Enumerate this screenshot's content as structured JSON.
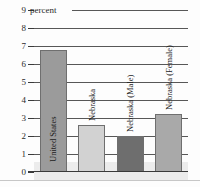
{
  "chart_data": {
    "type": "bar",
    "title": "",
    "subtitle": "",
    "xlabel": "",
    "ylabel": "percent",
    "unit_caption": "percent",
    "ylim": [
      0,
      9
    ],
    "grid": true,
    "legend": "none",
    "y_ticks": [
      "0",
      "1",
      "2",
      "3",
      "4",
      "5",
      "6",
      "7",
      "8",
      "9"
    ],
    "categories": [
      "United States",
      "Nebraska",
      "Nebraska (Male)",
      "Nebraska (Female)"
    ],
    "values": [
      6.8,
      2.6,
      2.0,
      3.2
    ],
    "bar_colors": [
      "#9b9b9b",
      "#d2d2d2",
      "#6e6e6e",
      "#a9a9a9"
    ]
  },
  "axis": {
    "tick_0": "0",
    "tick_1": "1",
    "tick_2": "2",
    "tick_3": "3",
    "tick_4": "4",
    "tick_5": "5",
    "tick_6": "6",
    "tick_7": "7",
    "tick_8": "8",
    "tick_9": "9",
    "unit": "percent"
  },
  "bars": {
    "bar_0_label": "United States",
    "bar_1_label": "Nebraska",
    "bar_2_label": "Nebraska (Male)",
    "bar_3_label": "Nebraska (Female)"
  },
  "colors": {
    "grid": "#3a3a3a",
    "text": "#2b2b2b",
    "band": "#ececec",
    "bar_outline": "#6f6f6f"
  }
}
